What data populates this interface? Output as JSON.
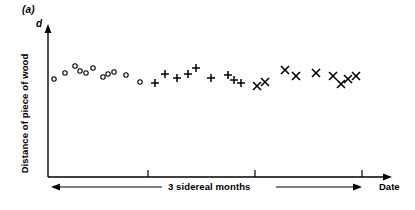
{
  "figure": {
    "panel_label": "(a)",
    "axis_symbol": "d",
    "ylabel": "Distance of piece of wood",
    "xlabel_right": "Date",
    "xspan_label": "3 sidereal months"
  },
  "colors": {
    "ink": "#000000",
    "background": "#ffffff"
  },
  "chart_data": {
    "type": "scatter",
    "title": "(a)",
    "xlabel": "Date",
    "ylabel": "Distance of piece of wood",
    "annotations": [
      {
        "text": "3 sidereal months",
        "role": "span-arrow-双headed",
        "x_from": 55,
        "x_to": 362
      },
      {
        "text": "d",
        "role": "y-axis-variable-symbol"
      },
      {
        "text": "(a)",
        "role": "panel-label"
      }
    ],
    "grid": false,
    "legend": "none",
    "axis_arrows": {
      "x": "right",
      "y": "up"
    },
    "xlim": [
      48,
      395
    ],
    "ylim": [
      0,
      100
    ],
    "xticks": [
      148,
      255,
      362
    ],
    "xtick_labels": [
      "",
      "",
      ""
    ],
    "yticks": [],
    "ytick_labels": [],
    "series": [
      {
        "name": "open-circle",
        "marker": "circle",
        "points": [
          {
            "x": 54,
            "y": 79
          },
          {
            "x": 65,
            "y": 73
          },
          {
            "x": 75,
            "y": 66
          },
          {
            "x": 80,
            "y": 71
          },
          {
            "x": 86,
            "y": 73
          },
          {
            "x": 93,
            "y": 68
          },
          {
            "x": 103,
            "y": 77
          },
          {
            "x": 108,
            "y": 74
          },
          {
            "x": 114,
            "y": 72
          },
          {
            "x": 126,
            "y": 75
          },
          {
            "x": 140,
            "y": 82
          }
        ]
      },
      {
        "name": "plus",
        "marker": "plus",
        "points": [
          {
            "x": 155,
            "y": 83
          },
          {
            "x": 165,
            "y": 74
          },
          {
            "x": 177,
            "y": 78
          },
          {
            "x": 188,
            "y": 74
          },
          {
            "x": 196,
            "y": 68
          },
          {
            "x": 211,
            "y": 78
          },
          {
            "x": 228,
            "y": 75
          },
          {
            "x": 234,
            "y": 80
          },
          {
            "x": 241,
            "y": 83
          }
        ]
      },
      {
        "name": "cross",
        "marker": "cross",
        "points": [
          {
            "x": 257,
            "y": 86
          },
          {
            "x": 265,
            "y": 82
          },
          {
            "x": 285,
            "y": 70
          },
          {
            "x": 296,
            "y": 76
          },
          {
            "x": 316,
            "y": 73
          },
          {
            "x": 333,
            "y": 76
          },
          {
            "x": 341,
            "y": 84
          },
          {
            "x": 348,
            "y": 79
          },
          {
            "x": 356,
            "y": 76
          }
        ]
      }
    ]
  }
}
